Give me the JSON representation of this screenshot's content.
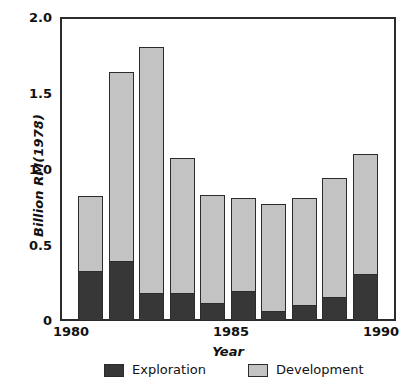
{
  "chart_data": {
    "type": "bar",
    "stacked": true,
    "title": "",
    "xlabel": "Year",
    "ylabel": "Billion RM(1978)",
    "categories": [
      "1980",
      "1981",
      "1982",
      "1983",
      "1984",
      "1985",
      "1986",
      "1987",
      "1988",
      "1989"
    ],
    "series": [
      {
        "name": "Exploration",
        "color": "#373737",
        "values": [
          0.32,
          0.39,
          0.18,
          0.18,
          0.11,
          0.19,
          0.06,
          0.1,
          0.15,
          0.3
        ]
      },
      {
        "name": "Development",
        "color": "#c3c3c3",
        "values": [
          0.5,
          1.25,
          1.62,
          0.89,
          0.72,
          0.62,
          0.71,
          0.71,
          0.79,
          0.8
        ]
      }
    ],
    "totals": [
      0.82,
      1.64,
      1.8,
      1.07,
      0.83,
      0.81,
      0.77,
      0.81,
      0.94,
      1.1
    ],
    "ylim": [
      0,
      2.0
    ],
    "yticks": [
      0,
      0.5,
      1.0,
      1.5,
      2.0
    ],
    "ytick_labels": [
      "0",
      "0.5",
      "1.0",
      "1.5",
      "2.0"
    ],
    "xlim": [
      1979.5,
      1990.5
    ],
    "xticks": [
      1980,
      1985,
      1990
    ],
    "xtick_labels": [
      "1980",
      "1985",
      "1990"
    ],
    "grid": false,
    "legend_position": "below"
  },
  "axes": {
    "y_title": "Billion RM(1978)",
    "x_title": "Year"
  },
  "legend": {
    "items": [
      {
        "label": "Exploration",
        "swatch": "dark"
      },
      {
        "label": "Development",
        "swatch": "light"
      }
    ]
  }
}
